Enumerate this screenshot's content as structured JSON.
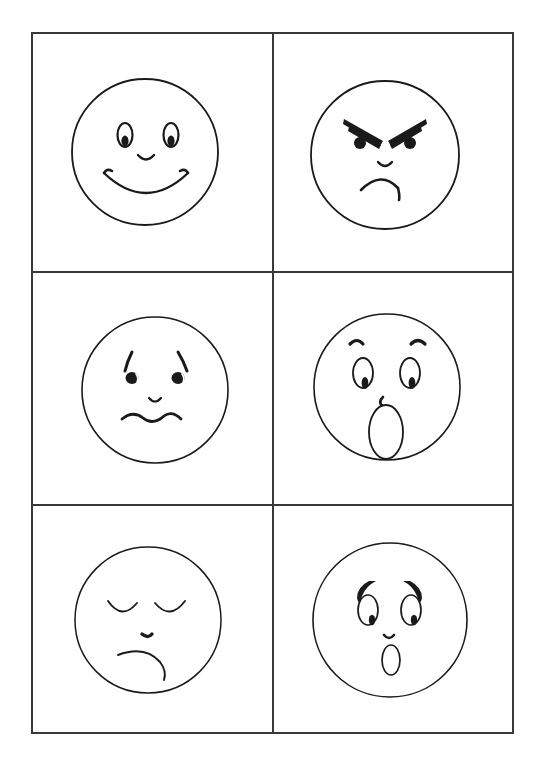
{
  "worksheet": {
    "title": "Emotion Faces Worksheet",
    "description": "Hand-drawn black-and-white line drawings of six cartoon faces arranged in a 2-column by 3-row grid with ruled borders.",
    "background_color": "#ffffff",
    "ink_color": "#1a1a1a",
    "border_color": "#3a3a3a",
    "grid": {
      "columns": 2,
      "rows": 3,
      "frame": {
        "x": 32,
        "y": 33,
        "width": 481,
        "height": 700
      },
      "column_divider_x": 273,
      "row_divider_y": [
        272,
        505
      ],
      "border_width": 2
    },
    "faces": [
      {
        "id": "face-happy",
        "emotion": "happy",
        "label": "Happy",
        "cell": {
          "row": 1,
          "column": 1
        },
        "center": {
          "x": 145,
          "y": 152
        },
        "radius": 73,
        "features": {
          "eyebrows": "none",
          "eyes": "tall-oval-outline-with-bottom-pupil",
          "nose": "small-downward-curve",
          "mouth": "wide-upturned-smile-with-curled-tips"
        }
      },
      {
        "id": "face-angry",
        "emotion": "angry",
        "label": "Angry",
        "cell": {
          "row": 1,
          "column": 2
        },
        "center": {
          "x": 385,
          "y": 155
        },
        "radius": 74,
        "features": {
          "eyebrows": "thick-tapered-wedges-slanting-down-to-center",
          "eyes": "solid-round-dots",
          "nose": "small-downward-curve",
          "mouth": "downturned-frown-with-small-tail"
        }
      },
      {
        "id": "face-sad",
        "emotion": "sad",
        "label": "Sad",
        "cell": {
          "row": 2,
          "column": 1
        },
        "center": {
          "x": 155,
          "y": 390
        },
        "radius": 73,
        "features": {
          "eyebrows": "short-comma-arcs-slanting-outward",
          "eyes": "solid-round-dots-with-highlight",
          "nose": "tiny-downward-curve",
          "mouth": "wavy-squiggle-line"
        }
      },
      {
        "id": "face-surprised",
        "emotion": "surprised",
        "label": "Surprised",
        "cell": {
          "row": 2,
          "column": 2
        },
        "center": {
          "x": 387,
          "y": 387
        },
        "radius": 73,
        "features": {
          "eyebrows": "small-raised-arcs-high-on-forehead",
          "eyes": "tall-oval-outline-with-bottom-pupil",
          "nose": "small-hook-curve",
          "mouth": "large-vertical-open-oval"
        }
      },
      {
        "id": "face-sleepy",
        "emotion": "sleepy",
        "label": "Sleepy",
        "cell": {
          "row": 3,
          "column": 1
        },
        "center": {
          "x": 148,
          "y": 620
        },
        "radius": 73,
        "features": {
          "eyebrows": "none",
          "eyes": "closed-downward-arcs",
          "nose": "tiny-dark-tick-mark",
          "mouth": "downturned-frown"
        }
      },
      {
        "id": "face-scared",
        "emotion": "scared",
        "label": "Scared",
        "cell": {
          "row": 3,
          "column": 2
        },
        "center": {
          "x": 390,
          "y": 620
        },
        "radius": 77,
        "features": {
          "eyebrows": "thick-tapered-hooks-curving-inward",
          "eyes": "oval-outline-with-bottom-inner-pupil",
          "nose": "tiny-hook-curve",
          "mouth": "small-vertical-open-oval"
        }
      }
    ]
  }
}
